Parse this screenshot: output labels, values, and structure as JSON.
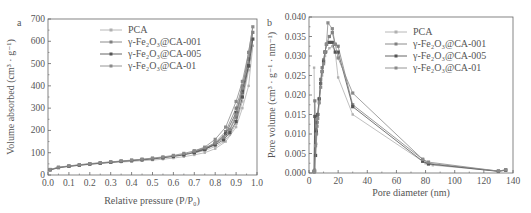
{
  "chart_data": [
    {
      "panel": "a",
      "type": "line",
      "xlabel": "Relative pressure (P/P0)",
      "ylabel": "Volume absorbed (cm3 · g-1)",
      "xlim": [
        0.0,
        1.0
      ],
      "ylim": [
        0,
        700
      ],
      "xticks": [
        "0.0",
        "0.1",
        "0.2",
        "0.3",
        "0.4",
        "0.5",
        "0.6",
        "0.7",
        "0.8",
        "0.9",
        "1.0"
      ],
      "yticks": [
        "0",
        "100",
        "200",
        "300",
        "400",
        "500",
        "600",
        "700"
      ],
      "grid": false,
      "legend_position": "upper-left",
      "series": [
        {
          "name": "PCA",
          "color": "#b0b0b0",
          "x": [
            0.01,
            0.05,
            0.1,
            0.15,
            0.2,
            0.25,
            0.3,
            0.35,
            0.4,
            0.45,
            0.5,
            0.55,
            0.6,
            0.65,
            0.7,
            0.75,
            0.8,
            0.85,
            0.9,
            0.93,
            0.96,
            0.98,
            0.96,
            0.93,
            0.9,
            0.87,
            0.84,
            0.8,
            0.75,
            0.7
          ],
          "y": [
            22,
            32,
            38,
            43,
            47,
            51,
            55,
            58,
            61,
            64,
            67,
            71,
            76,
            82,
            90,
            100,
            118,
            150,
            215,
            300,
            400,
            580,
            470,
            330,
            230,
            180,
            150,
            128,
            110,
            98
          ]
        },
        {
          "name": "γ-Fe2O3@CA-001",
          "color": "#808080",
          "x": [
            0.01,
            0.05,
            0.1,
            0.15,
            0.2,
            0.25,
            0.3,
            0.35,
            0.4,
            0.45,
            0.5,
            0.55,
            0.6,
            0.65,
            0.7,
            0.75,
            0.8,
            0.85,
            0.9,
            0.93,
            0.96,
            0.98,
            0.96,
            0.93,
            0.9,
            0.87,
            0.84,
            0.8,
            0.75,
            0.7
          ],
          "y": [
            24,
            34,
            40,
            45,
            50,
            54,
            58,
            62,
            66,
            70,
            74,
            79,
            85,
            93,
            103,
            118,
            145,
            195,
            300,
            400,
            520,
            640,
            520,
            370,
            260,
            200,
            165,
            140,
            120,
            106
          ]
        },
        {
          "name": "γ-Fe2O3@CA-005",
          "color": "#555555",
          "x": [
            0.01,
            0.05,
            0.1,
            0.15,
            0.2,
            0.25,
            0.3,
            0.35,
            0.4,
            0.45,
            0.5,
            0.55,
            0.6,
            0.65,
            0.7,
            0.75,
            0.8,
            0.85,
            0.9,
            0.93,
            0.96,
            0.98,
            0.96,
            0.93,
            0.9,
            0.87,
            0.84,
            0.8,
            0.75,
            0.7
          ],
          "y": [
            23,
            33,
            39,
            44,
            49,
            53,
            57,
            61,
            64,
            68,
            72,
            77,
            83,
            90,
            100,
            114,
            140,
            185,
            280,
            380,
            490,
            610,
            490,
            350,
            240,
            190,
            158,
            135,
            116,
            102
          ]
        },
        {
          "name": "γ-Fe2O3@CA-01",
          "color": "#8a8a8a",
          "x": [
            0.01,
            0.05,
            0.1,
            0.15,
            0.2,
            0.25,
            0.3,
            0.35,
            0.4,
            0.45,
            0.5,
            0.55,
            0.6,
            0.65,
            0.7,
            0.75,
            0.8,
            0.85,
            0.9,
            0.93,
            0.96,
            0.98,
            0.96,
            0.93,
            0.9,
            0.87,
            0.84,
            0.8,
            0.75,
            0.7
          ],
          "y": [
            25,
            35,
            41,
            46,
            51,
            55,
            59,
            63,
            67,
            71,
            76,
            81,
            88,
            97,
            108,
            125,
            160,
            215,
            330,
            420,
            550,
            665,
            550,
            390,
            270,
            205,
            170,
            143,
            122,
            108
          ]
        }
      ]
    },
    {
      "panel": "b",
      "type": "line",
      "xlabel": "Pore diameter (nm)",
      "ylabel": "Pore volume (cm3 · g-1 · nm-1)",
      "xlim": [
        0,
        140
      ],
      "ylim": [
        0.0,
        0.04
      ],
      "xticks": [
        "0",
        "20",
        "40",
        "60",
        "80",
        "100",
        "120",
        "140"
      ],
      "yticks": [
        "0.000",
        "0.005",
        "0.010",
        "0.015",
        "0.020",
        "0.025",
        "0.030",
        "0.035",
        "0.040"
      ],
      "grid": false,
      "legend_position": "upper-right",
      "series": [
        {
          "name": "PCA",
          "color": "#b0b0b0",
          "x": [
            3.5,
            4,
            4.5,
            5,
            5.5,
            6,
            7,
            8,
            9,
            10,
            11,
            12,
            14,
            16,
            18,
            20,
            30,
            80,
            85,
            130,
            135
          ],
          "y": [
            0.027,
            0.001,
            0.0045,
            0.0075,
            0.01,
            0.013,
            0.018,
            0.022,
            0.025,
            0.028,
            0.03,
            0.031,
            0.032,
            0.0325,
            0.031,
            0.0245,
            0.015,
            0.0025,
            0.002,
            0.0005,
            0.0008
          ]
        },
        {
          "name": "γ-Fe2O3@CA-001",
          "color": "#808080",
          "x": [
            3.5,
            4,
            4.5,
            5,
            5.5,
            6,
            7,
            8,
            9,
            10,
            11,
            12,
            14,
            16,
            18,
            20,
            30,
            78,
            82,
            130,
            135
          ],
          "y": [
            0.0005,
            0.0185,
            0.0105,
            0.011,
            0.013,
            0.015,
            0.019,
            0.024,
            0.027,
            0.029,
            0.031,
            0.033,
            0.035,
            0.036,
            0.033,
            0.0325,
            0.0175,
            0.0035,
            0.0025,
            0.0005,
            0.0008
          ]
        },
        {
          "name": "γ-Fe2O3@CA-005",
          "color": "#555555",
          "x": [
            3.5,
            4,
            4.5,
            5,
            5.5,
            6,
            7,
            8,
            9,
            10,
            11,
            12,
            14,
            16,
            18,
            20,
            30,
            78,
            82,
            130,
            135
          ],
          "y": [
            0.0003,
            0.0145,
            0.0045,
            0.0105,
            0.0145,
            0.015,
            0.019,
            0.023,
            0.026,
            0.0285,
            0.031,
            0.033,
            0.0335,
            0.0335,
            0.031,
            0.031,
            0.017,
            0.003,
            0.0023,
            0.0004,
            0.0007
          ]
        },
        {
          "name": "γ-Fe2O3@CA-01",
          "color": "#8a8a8a",
          "x": [
            3.5,
            4,
            4.5,
            5,
            5.5,
            6,
            7,
            8,
            9,
            10,
            11,
            12,
            13,
            16,
            18,
            20,
            30,
            78,
            82,
            130,
            135
          ],
          "y": [
            0.0004,
            0.0005,
            0.007,
            0.01,
            0.012,
            0.014,
            0.018,
            0.022,
            0.026,
            0.028,
            0.031,
            0.033,
            0.0385,
            0.037,
            0.033,
            0.0295,
            0.0205,
            0.0035,
            0.0028,
            0.0005,
            0.0008
          ]
        }
      ]
    }
  ],
  "panel_a": {
    "letter": "a",
    "xlabel": "Relative pressure (P/P₀)",
    "ylabel": "Volume absorbed (cm³ · g⁻¹)",
    "legend": [
      "PCA",
      "γ-Fe₂O₃@CA-001",
      "γ-Fe₂O₃@CA-005",
      "γ-Fe₂O₃@CA-01"
    ]
  },
  "panel_b": {
    "letter": "b",
    "xlabel": "Pore diameter (nm)",
    "ylabel": "Pore volume (cm³ · g⁻¹ · nm⁻¹)",
    "legend": [
      "PCA",
      "γ-Fe₂O₃@CA-001",
      "γ-Fe₂O₃@CA-005",
      "γ-Fe₂O₃@CA-01"
    ]
  }
}
